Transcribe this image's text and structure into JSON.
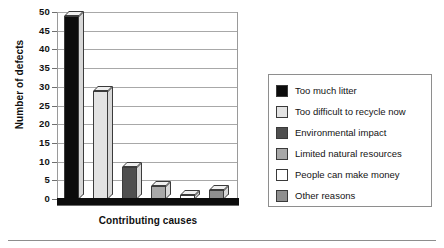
{
  "chart_data": {
    "type": "bar",
    "title": "",
    "xlabel": "Contributing causes",
    "ylabel": "Number of defects",
    "categories": [
      "Too much litter",
      "Too difficult to recycle now",
      "Environmental impact",
      "Limited natural resources",
      "People can make money",
      "Other reasons"
    ],
    "values": [
      49,
      29,
      8.5,
      3.5,
      1,
      2.5
    ],
    "ylim": [
      0,
      50
    ],
    "ytick_values": [
      0,
      5,
      10,
      15,
      20,
      25,
      30,
      35,
      40,
      45,
      50
    ],
    "ytick_labels": [
      "0",
      "5",
      "10",
      "15",
      "20",
      "25",
      "30",
      "35",
      "40",
      "45",
      "50"
    ],
    "grid": true,
    "legend_position": "right",
    "series_colors": [
      "#0c0c0c",
      "#e3e3e3",
      "#4f4f4f",
      "#a8a8a8",
      "#ffffff",
      "#8f8f8f"
    ]
  },
  "legend": {
    "items": [
      {
        "label": "Too much litter",
        "color": "#0c0c0c"
      },
      {
        "label": "Too difficult to recycle now",
        "color": "#e3e3e3"
      },
      {
        "label": "Environmental impact",
        "color": "#4f4f4f"
      },
      {
        "label": "Limited natural resources",
        "color": "#a8a8a8"
      },
      {
        "label": "People can make money",
        "color": "#ffffff"
      },
      {
        "label": "Other reasons",
        "color": "#8f8f8f"
      }
    ]
  }
}
